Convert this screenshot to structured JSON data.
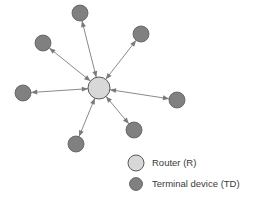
{
  "figure": {
    "background_color": "#ffffff",
    "width": 255,
    "height": 205
  },
  "colors": {
    "router_fill": "#d8d8d8",
    "router_stroke": "#5a5a5a",
    "terminal_fill": "#808080",
    "terminal_stroke": "#595959",
    "link_stroke": "#8a8a8a",
    "arrow_fill": "#7a7a7a",
    "legend_text": "#3a3a3a",
    "background": "#ffffff"
  },
  "chart_data": {
    "type": "diagram",
    "diagram_type": "star-network-topology",
    "title": "",
    "nodes": [
      {
        "id": "R",
        "label": "Router (R)",
        "role": "router",
        "x": 99,
        "y": 88,
        "r": 11
      },
      {
        "id": "TD1",
        "label": "Terminal device (TD)",
        "role": "terminal",
        "x": 80,
        "y": 13,
        "r": 8
      },
      {
        "id": "TD2",
        "label": "Terminal device (TD)",
        "role": "terminal",
        "x": 141,
        "y": 34,
        "r": 8
      },
      {
        "id": "TD3",
        "label": "Terminal device (TD)",
        "role": "terminal",
        "x": 43,
        "y": 43,
        "r": 8
      },
      {
        "id": "TD4",
        "label": "Terminal device (TD)",
        "role": "terminal",
        "x": 23,
        "y": 93,
        "r": 8
      },
      {
        "id": "TD5",
        "label": "Terminal device (TD)",
        "role": "terminal",
        "x": 177,
        "y": 100,
        "r": 8
      },
      {
        "id": "TD6",
        "label": "Terminal device (TD)",
        "role": "terminal",
        "x": 134,
        "y": 130,
        "r": 8
      },
      {
        "id": "TD7",
        "label": "Terminal device (TD)",
        "role": "terminal",
        "x": 76,
        "y": 144,
        "r": 8
      }
    ],
    "edges": [
      {
        "from": "R",
        "to": "TD1",
        "direction": "bidirectional"
      },
      {
        "from": "R",
        "to": "TD2",
        "direction": "bidirectional"
      },
      {
        "from": "R",
        "to": "TD3",
        "direction": "bidirectional"
      },
      {
        "from": "R",
        "to": "TD4",
        "direction": "bidirectional"
      },
      {
        "from": "R",
        "to": "TD5",
        "direction": "bidirectional"
      },
      {
        "from": "R",
        "to": "TD6",
        "direction": "bidirectional"
      },
      {
        "from": "R",
        "to": "TD7",
        "direction": "bidirectional"
      }
    ],
    "router_count": 1,
    "terminal_count": 7
  },
  "legend": {
    "position": "bottom-right",
    "items": [
      {
        "key": "router",
        "label": "Router (R)",
        "swatch": "circle",
        "x": 136,
        "y": 163,
        "r": 8,
        "text_x": 152,
        "text_y": 163
      },
      {
        "key": "terminal",
        "label": "Terminal device (TD)",
        "swatch": "circle",
        "x": 136,
        "y": 184,
        "r": 6.5,
        "text_x": 152,
        "text_y": 184
      }
    ]
  }
}
